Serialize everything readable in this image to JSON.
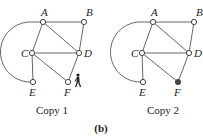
{
  "figure": {
    "subfigure_label": "(b)",
    "copies": [
      {
        "caption": "Copy 1",
        "offset_x": 0,
        "marker": "walking-person-icon",
        "marker_at": "F",
        "filled_nodes": []
      },
      {
        "caption": "Copy 2",
        "offset_x": 110,
        "marker": null,
        "filled_nodes": [
          "F"
        ]
      }
    ],
    "nodes": [
      {
        "id": "A",
        "x": 43,
        "y": 22,
        "label_dx": -2,
        "label_dy": -6
      },
      {
        "id": "B",
        "x": 84,
        "y": 22,
        "label_dx": 2,
        "label_dy": -6
      },
      {
        "id": "C",
        "x": 32,
        "y": 53,
        "label_dx": -11,
        "label_dy": 4
      },
      {
        "id": "D",
        "x": 79,
        "y": 53,
        "label_dx": 5,
        "label_dy": 4
      },
      {
        "id": "E",
        "x": 33,
        "y": 82,
        "label_dx": -4,
        "label_dy": 14
      },
      {
        "id": "F",
        "x": 68,
        "y": 82,
        "label_dx": -4,
        "label_dy": 14
      }
    ],
    "edges": [
      [
        "A",
        "B"
      ],
      [
        "A",
        "C"
      ],
      [
        "A",
        "D"
      ],
      [
        "B",
        "D"
      ],
      [
        "C",
        "D"
      ],
      [
        "C",
        "E"
      ],
      [
        "C",
        "F"
      ],
      [
        "D",
        "F"
      ],
      [
        "A",
        "E",
        "arc"
      ]
    ]
  }
}
